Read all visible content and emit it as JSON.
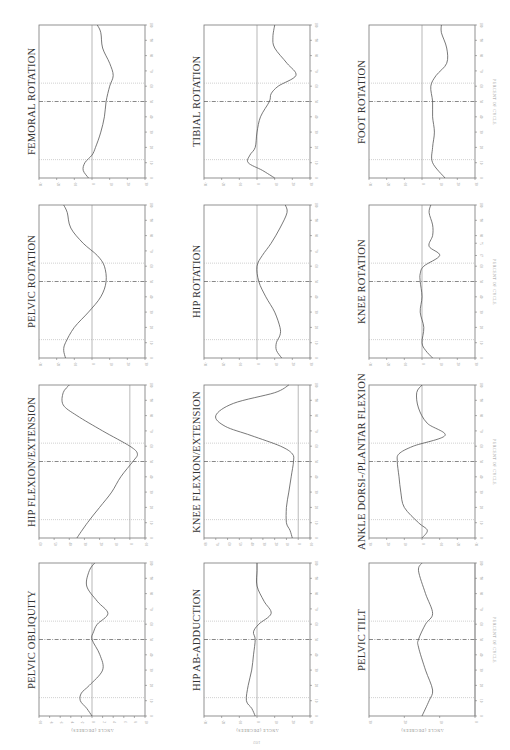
{
  "page": {
    "page_number": "102",
    "orientation": "rotated 90° (landscape content on portrait page)"
  },
  "axis_labels": {
    "y": "ANGLE (DEGREES)",
    "x": "PERCENT OF CYCLE"
  },
  "event_lines": [
    {
      "name": "opposite-toe-off",
      "percent": 12,
      "style": "dotted"
    },
    {
      "name": "opposite-foot-strike",
      "percent": 50,
      "style": "dash-dot"
    },
    {
      "name": "toe-off",
      "percent": 62,
      "style": "dotted"
    }
  ],
  "chart_data": [
    {
      "type": "line",
      "title": "FEMORAL ROTATION",
      "xlabel": "PERCENT OF CYCLE",
      "ylabel": "ANGLE (DEGREES)",
      "xlim": [
        0,
        100
      ],
      "ylim": [
        -30,
        30
      ],
      "x_ticks": [
        0,
        10,
        20,
        30,
        40,
        50,
        60,
        70,
        80,
        90,
        100
      ],
      "y_ticks": [
        -30,
        -20,
        -10,
        0,
        10,
        20,
        30
      ],
      "x": [
        0,
        5,
        10,
        15,
        20,
        30,
        40,
        50,
        60,
        67,
        75,
        85,
        95,
        100
      ],
      "values": [
        -2,
        -5,
        -4,
        0,
        2,
        5,
        7,
        8,
        10,
        12,
        10,
        6,
        5,
        3
      ]
    },
    {
      "type": "line",
      "title": "TIBIAL ROTATION",
      "xlabel": "PERCENT OF CYCLE",
      "ylabel": "ANGLE (DEGREES)",
      "xlim": [
        0,
        100
      ],
      "ylim": [
        -30,
        30
      ],
      "x_ticks": [
        0,
        10,
        20,
        30,
        40,
        50,
        60,
        70,
        80,
        90,
        100
      ],
      "y_ticks": [
        -30,
        -20,
        -10,
        0,
        10,
        20,
        30
      ],
      "x": [
        0,
        5,
        10,
        15,
        20,
        30,
        40,
        50,
        55,
        60,
        67,
        75,
        85,
        92,
        100
      ],
      "values": [
        10,
        3,
        -5,
        -4,
        -1,
        0,
        2,
        7,
        8,
        12,
        22,
        17,
        10,
        9,
        10
      ]
    },
    {
      "type": "line",
      "title": "FOOT ROTATION",
      "xlabel": "PERCENT OF CYCLE",
      "ylabel": "ANGLE (DEGREES)",
      "xlim": [
        0,
        100
      ],
      "ylim": [
        -30,
        30
      ],
      "x_ticks": [
        0,
        10,
        20,
        30,
        40,
        50,
        60,
        70,
        80,
        90,
        100
      ],
      "y_ticks": [
        -30,
        -20,
        -10,
        0,
        10,
        20,
        30
      ],
      "x": [
        0,
        10,
        20,
        30,
        40,
        50,
        60,
        67,
        75,
        85,
        95,
        100
      ],
      "values": [
        13,
        6,
        6,
        7,
        6,
        6,
        5,
        8,
        14,
        14,
        11,
        11
      ]
    },
    {
      "type": "line",
      "title": "PELVIC ROTATION",
      "xlabel": "PERCENT OF CYCLE",
      "ylabel": "ANGLE (DEGREES)",
      "xlim": [
        0,
        100
      ],
      "ylim": [
        -30,
        30
      ],
      "x_ticks": [
        0,
        10,
        20,
        30,
        40,
        50,
        60,
        70,
        80,
        90,
        100
      ],
      "y_ticks": [
        -30,
        -20,
        -10,
        0,
        10,
        20,
        30
      ],
      "x": [
        0,
        5,
        10,
        20,
        30,
        40,
        50,
        60,
        67,
        75,
        85,
        95,
        100
      ],
      "values": [
        -15,
        -16,
        -15,
        -10,
        -2,
        5,
        8,
        7,
        3,
        -5,
        -12,
        -14,
        -16
      ]
    },
    {
      "type": "line",
      "title": "HIP ROTATION",
      "xlabel": "PERCENT OF CYCLE",
      "ylabel": "ANGLE (DEGREES)",
      "xlim": [
        0,
        100
      ],
      "ylim": [
        -30,
        30
      ],
      "x_ticks": [
        0,
        10,
        20,
        30,
        40,
        50,
        60,
        70,
        80,
        90,
        100
      ],
      "y_ticks": [
        -30,
        -20,
        -10,
        0,
        10,
        20,
        30
      ],
      "x": [
        0,
        5,
        10,
        15,
        20,
        30,
        40,
        50,
        60,
        67,
        75,
        85,
        95,
        100
      ],
      "values": [
        14,
        11,
        11,
        13,
        13,
        10,
        5,
        1,
        0,
        3,
        8,
        13,
        17,
        16
      ]
    },
    {
      "type": "line",
      "title": "KNEE ROTATION",
      "xlabel": "PERCENT OF CYCLE",
      "ylabel": "ANGLE (DEGREES)",
      "xlim": [
        0,
        100
      ],
      "ylim": [
        -30,
        30
      ],
      "x_ticks": [
        0,
        10,
        20,
        30,
        40,
        50,
        60,
        67,
        75,
        80,
        90,
        100
      ],
      "y_ticks": [
        -30,
        -20,
        -10,
        0,
        10,
        20,
        30
      ],
      "x": [
        0,
        5,
        10,
        20,
        30,
        40,
        50,
        55,
        60,
        67,
        73,
        80,
        87,
        95,
        100
      ],
      "values": [
        6,
        2,
        0,
        1,
        -1,
        0,
        -1,
        -1,
        1,
        10,
        4,
        6,
        6,
        4,
        5
      ]
    },
    {
      "type": "line",
      "title": "HIP FLEXION/EXTENSION",
      "xlabel": "PERCENT OF CYCLE",
      "ylabel": "ANGLE (DEGREES)",
      "xlim": [
        0,
        100
      ],
      "ylim": [
        60,
        -10
      ],
      "x_ticks": [
        0,
        10,
        20,
        30,
        40,
        50,
        60,
        70,
        80,
        90,
        100
      ],
      "y_ticks": [
        60,
        50,
        40,
        30,
        20,
        10,
        0,
        -10
      ],
      "x": [
        0,
        10,
        20,
        30,
        40,
        50,
        55,
        60,
        70,
        80,
        87,
        95,
        100
      ],
      "values": [
        35,
        28,
        20,
        12,
        6,
        -2,
        -5,
        0,
        18,
        35,
        44,
        44,
        40
      ]
    },
    {
      "type": "line",
      "title": "KNEE FLEXION/EXTENSION",
      "xlabel": "PERCENT OF CYCLE",
      "ylabel": "ANGLE (DEGREES)",
      "xlim": [
        0,
        100
      ],
      "ylim": [
        80,
        -10
      ],
      "x_ticks": [
        0,
        10,
        20,
        30,
        40,
        50,
        60,
        70,
        80,
        90,
        100
      ],
      "y_ticks": [
        80,
        70,
        60,
        50,
        40,
        30,
        20,
        10,
        0,
        -10
      ],
      "x": [
        0,
        5,
        10,
        20,
        30,
        40,
        50,
        55,
        60,
        67,
        73,
        80,
        88,
        95,
        100
      ],
      "values": [
        5,
        7,
        10,
        10,
        8,
        6,
        4,
        5,
        15,
        40,
        62,
        70,
        55,
        20,
        8
      ]
    },
    {
      "type": "line",
      "title": "ANKLE DORSI-/PLANTAR FLEXION",
      "xlabel": "PERCENT OF CYCLE",
      "ylabel": "ANGLE (DEGREES)",
      "xlim": [
        0,
        100
      ],
      "ylim": [
        30,
        -30
      ],
      "x_ticks": [
        0,
        10,
        20,
        30,
        40,
        50,
        60,
        70,
        80,
        90,
        100
      ],
      "y_ticks": [
        30,
        20,
        10,
        0,
        -10,
        -20,
        -30
      ],
      "x": [
        0,
        5,
        10,
        20,
        30,
        40,
        50,
        55,
        60,
        67,
        75,
        85,
        95,
        100
      ],
      "values": [
        0,
        -3,
        2,
        10,
        12,
        13,
        14,
        13,
        5,
        -13,
        -3,
        2,
        3,
        0
      ]
    },
    {
      "type": "line",
      "title": "PELVIC OBLIQUITY",
      "xlabel": "PERCENT OF CYCLE",
      "ylabel": "ANGLE (DEGREES)",
      "xlim": [
        0,
        100
      ],
      "ylim": [
        -10,
        10
      ],
      "x_ticks": [
        0,
        10,
        20,
        30,
        40,
        50,
        60,
        70,
        80,
        90,
        100
      ],
      "y_ticks": [
        -10,
        -8,
        -6,
        -4,
        -2,
        0,
        2,
        4,
        6,
        8,
        10
      ],
      "x": [
        0,
        5,
        10,
        15,
        20,
        30,
        40,
        50,
        55,
        60,
        67,
        75,
        85,
        95,
        100
      ],
      "values": [
        0,
        -1,
        -2.2,
        -2,
        -0.5,
        2,
        1.5,
        0,
        0.3,
        1,
        3,
        1,
        -1,
        -0.5,
        0.5
      ]
    },
    {
      "type": "line",
      "title": "HIP AB-ADDUCTION",
      "xlabel": "PERCENT OF CYCLE",
      "ylabel": "ANGLE (DEGREES)",
      "xlim": [
        0,
        100
      ],
      "ylim": [
        -30,
        30
      ],
      "x_ticks": [
        0,
        10,
        20,
        30,
        40,
        50,
        60,
        70,
        80,
        90,
        100
      ],
      "y_ticks": [
        -30,
        -20,
        -10,
        0,
        10,
        20,
        30
      ],
      "x": [
        0,
        5,
        10,
        20,
        30,
        40,
        50,
        55,
        60,
        67,
        75,
        85,
        95,
        100
      ],
      "values": [
        -1,
        -3,
        -6,
        -5,
        -3,
        -2,
        -1,
        -2,
        1,
        8,
        4,
        0,
        0,
        0
      ]
    },
    {
      "type": "line",
      "title": "PELVIC TILT",
      "xlabel": "PERCENT OF CYCLE",
      "ylabel": "ANGLE (DEGREES)",
      "xlim": [
        0,
        100
      ],
      "ylim": [
        30,
        0
      ],
      "x_ticks": [
        0,
        10,
        20,
        30,
        40,
        50,
        60,
        70,
        80,
        90,
        100
      ],
      "y_ticks": [
        30,
        20,
        10,
        0
      ],
      "x": [
        0,
        10,
        17,
        30,
        45,
        50,
        60,
        67,
        80,
        95,
        100
      ],
      "values": [
        15,
        13,
        12,
        14,
        16,
        16,
        14,
        12,
        14,
        16,
        15
      ]
    }
  ]
}
